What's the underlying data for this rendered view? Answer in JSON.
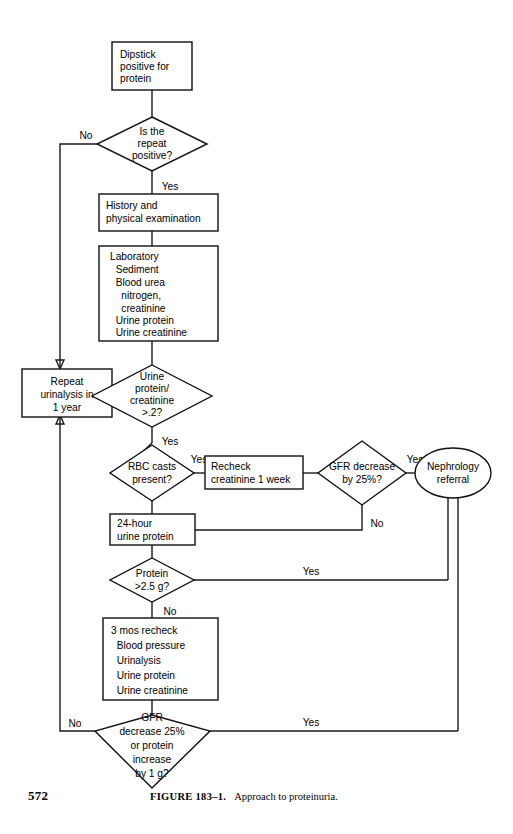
{
  "figure": {
    "page_number": "572",
    "caption_label": "FIGURE 183–1.",
    "caption_text": "Approach to proteinuria.",
    "title": "Approach to proteinuria"
  },
  "diagram": {
    "type": "flowchart",
    "orientation": "top-to-bottom",
    "nodes": [
      {
        "id": "dipstick",
        "shape": "rect",
        "lines": [
          "Dipstick",
          "positive for",
          "protein"
        ],
        "align": "left"
      },
      {
        "id": "repeat-positive",
        "shape": "diamond",
        "lines": [
          "Is the",
          "repeat",
          "positive?"
        ],
        "align": "center"
      },
      {
        "id": "history-physical",
        "shape": "rect",
        "lines": [
          "History and",
          "physical examination"
        ],
        "align": "left"
      },
      {
        "id": "laboratory",
        "shape": "rect",
        "lines": [
          "Laboratory",
          "  Sediment",
          "  Blood urea",
          "    nitrogen,",
          "    creatinine",
          "  Urine protein",
          "  Urine creatinine"
        ],
        "align": "left"
      },
      {
        "id": "repeat-urinalysis",
        "shape": "rect",
        "lines": [
          "Repeat",
          "urinalysis in",
          "1 year"
        ],
        "align": "center"
      },
      {
        "id": "urine-protein-creatinine-ratio",
        "shape": "diamond",
        "lines": [
          "Urine",
          "protein/",
          "creatinine",
          ">.2?"
        ],
        "align": "center"
      },
      {
        "id": "rbc-casts",
        "shape": "diamond",
        "lines": [
          "RBC casts",
          "present?"
        ],
        "align": "center"
      },
      {
        "id": "recheck-creatinine",
        "shape": "rect",
        "lines": [
          "Recheck",
          "creatinine 1 week"
        ],
        "align": "left"
      },
      {
        "id": "gfr-decrease-25",
        "shape": "diamond",
        "lines": [
          "GFR decrease",
          "by 25%?"
        ],
        "align": "center"
      },
      {
        "id": "nephrology-referral",
        "shape": "ellipse",
        "lines": [
          "Nephrology",
          "referral"
        ],
        "align": "center"
      },
      {
        "id": "24-hour-urine-protein",
        "shape": "rect",
        "lines": [
          "24-hour",
          "urine protein"
        ],
        "align": "left"
      },
      {
        "id": "protein-25g",
        "shape": "diamond",
        "lines": [
          "Protein",
          ">2.5 g?"
        ],
        "align": "center"
      },
      {
        "id": "3-mos-recheck",
        "shape": "rect",
        "lines": [
          "3 mos recheck",
          "  Blood pressure",
          "  Urinalysis",
          "  Urine protein",
          "  Urine creatinine"
        ],
        "align": "left"
      },
      {
        "id": "gfr-decrease-or-protein-increase",
        "shape": "diamond",
        "lines": [
          "GFR",
          "decrease 25%",
          "or protein",
          "increase",
          "by 1 g?"
        ],
        "align": "center"
      }
    ],
    "edge_labels": {
      "repeat_positive_no": "No",
      "repeat_positive_yes": "Yes",
      "ratio_no": "No",
      "ratio_yes": "Yes",
      "rbc_casts_yes": "Yes",
      "gfr25_yes": "Yes",
      "gfr25_no": "No",
      "protein_yes": "Yes",
      "protein_no": "No",
      "final_no": "No",
      "final_yes": "Yes"
    },
    "colors": {
      "stroke": "#111111",
      "fill": "#ffffff",
      "text": "#000000"
    }
  }
}
